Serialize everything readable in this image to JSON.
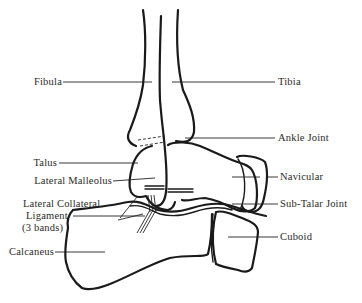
{
  "diagram": {
    "colors": {
      "line": "#1a1a1a",
      "label": "#2a2a2a",
      "background": "#ffffff"
    },
    "labels": {
      "fibula": "Fibula",
      "tibia": "Tibia",
      "ankle_joint": "Ankle Joint",
      "talus": "Talus",
      "lateral_malleolus": "Lateral Malleolus",
      "navicular": "Navicular",
      "lateral_collateral_line1": "Lateral Collateral",
      "lateral_collateral_line2": "Ligament",
      "lateral_collateral_line3": "(3 bands)",
      "sub_talar_joint": "Sub-Talar Joint",
      "cuboid": "Cuboid",
      "calcaneus": "Calcaneus"
    }
  }
}
